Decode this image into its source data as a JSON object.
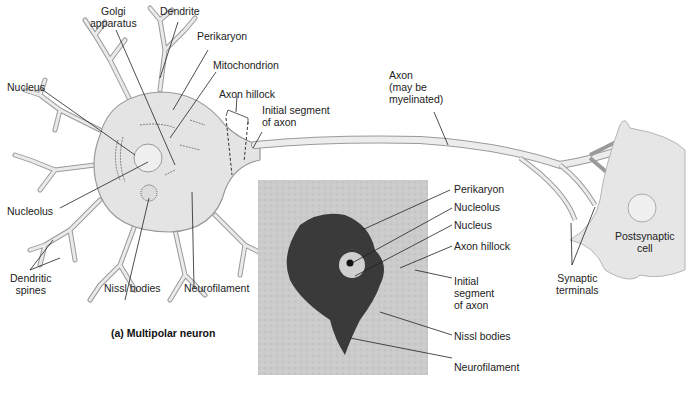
{
  "figure": {
    "caption": "(a) Multipolar neuron",
    "colors": {
      "cell_fill": "#e4e4e4",
      "cell_stroke": "#9a9a9a",
      "leader_line": "#222222",
      "micrograph_bg": "#cfcfcf",
      "stained_cell": "#3a3a3a"
    }
  },
  "drawing_labels": {
    "golgi": [
      "Golgi",
      "apparatus"
    ],
    "dendrite": "Dendrite",
    "perikaryon": "Perikaryon",
    "mitochondrion": "Mitochondrion",
    "nucleus": "Nucleus",
    "axon_hillock": "Axon hillock",
    "initial_segment": [
      "Initial  segment",
      "of axon"
    ],
    "axon": [
      "Axon",
      "(may be",
      "myelinated)"
    ],
    "nucleolus": "Nucleolus",
    "dendritic_spines": [
      "Dendritic",
      "spines"
    ],
    "nissl_bodies": "Nissl bodies",
    "neurofilament": "Neurofilament",
    "postsynaptic_cell": [
      "Postsynaptic",
      "cell"
    ],
    "synaptic_terminals": [
      "Synaptic",
      "terminals"
    ]
  },
  "micrograph_labels": {
    "perikaryon": "Perikaryon",
    "nucleolus": "Nucleolus",
    "nucleus": "Nucleus",
    "axon_hillock": "Axon hillock",
    "initial_segment": [
      "Initial",
      "segment",
      "of axon"
    ],
    "nissl_bodies": "Nissl bodies",
    "neurofilament": "Neurofilament"
  }
}
